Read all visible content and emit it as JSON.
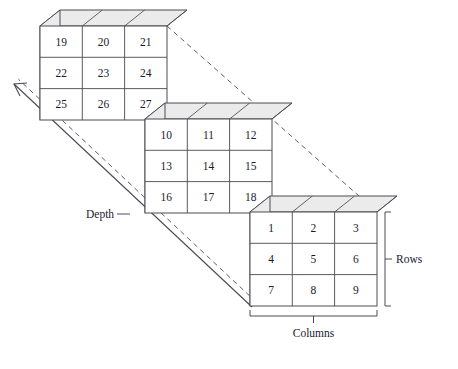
{
  "figure": {
    "type": "3d-array-diagram",
    "background_color": "#ffffff",
    "line_color": "#4a4a55",
    "face_fill": "#ffffff",
    "side_face_fill": "#ebebeb",
    "text_color": "#1a1a2e"
  },
  "slices": [
    {
      "name": "back-slice",
      "origin_x": 40,
      "origin_y": 26,
      "rows": [
        [
          "19",
          "20",
          "21"
        ],
        [
          "22",
          "23",
          "24"
        ],
        [
          "25",
          "26",
          "27"
        ]
      ]
    },
    {
      "name": "middle-slice",
      "origin_x": 145,
      "origin_y": 119,
      "rows": [
        [
          "10",
          "11",
          "12"
        ],
        [
          "13",
          "14",
          "15"
        ],
        [
          "16",
          "17",
          "18"
        ]
      ]
    },
    {
      "name": "front-slice",
      "origin_x": 250,
      "origin_y": 212,
      "rows": [
        [
          "1",
          "2",
          "3"
        ],
        [
          "4",
          "5",
          "6"
        ],
        [
          "7",
          "8",
          "9"
        ]
      ]
    }
  ],
  "geometry": {
    "cell_width": 42.3,
    "cell_height": 31.3,
    "face_width": 127,
    "face_height": 94,
    "oblique_dx": 20,
    "oblique_dy": -16,
    "slice_step_x": 105,
    "slice_step_y": 93
  },
  "annotations": {
    "depth_label": "Depth",
    "rows_label": "Rows",
    "columns_label": "Columns"
  }
}
